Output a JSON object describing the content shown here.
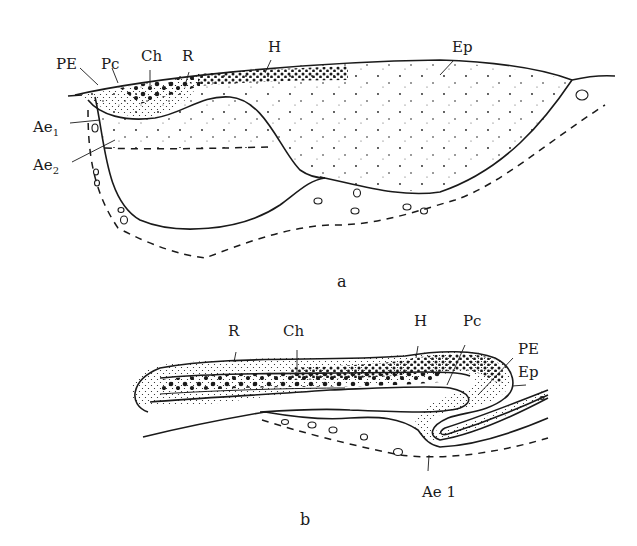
{
  "figure": {
    "panel_a": {
      "caption": "a",
      "labels": {
        "PE": "PE",
        "Pc": "Pc",
        "Ch": "Ch",
        "R": "R",
        "H": "H",
        "Ep": "Ep",
        "Ae1_base": "Ae",
        "Ae1_sub": "1",
        "Ae2_base": "Ae",
        "Ae2_sub": "2"
      }
    },
    "panel_b": {
      "caption": "b",
      "labels": {
        "R": "R",
        "Ch": "Ch",
        "H": "H",
        "Pc": "Pc",
        "PE": "PE",
        "Ep": "Ep",
        "Ae1": "Ae 1"
      }
    },
    "colors": {
      "ink": "#1a1a1a",
      "background": "#ffffff"
    }
  }
}
